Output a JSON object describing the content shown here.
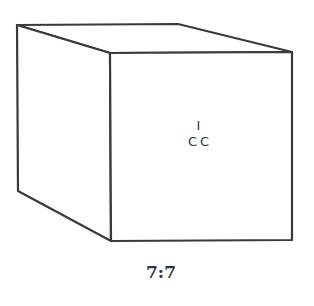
{
  "figure": {
    "type": "cube-line-drawing",
    "stroke_color": "#3a3a3a",
    "background": "#ffffff",
    "front_face_label": {
      "line1": "I",
      "line2": "CC"
    },
    "caption": "7:7"
  }
}
